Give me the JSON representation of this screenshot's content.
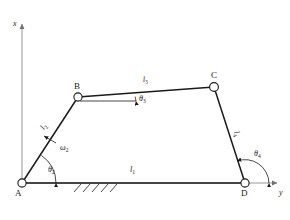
{
  "figure": {
    "type": "four-bar-linkage-kinematic-diagram",
    "background_color": "#ffffff",
    "line_color": "#1a1a1a",
    "axis_color": "#8a8a8a"
  },
  "axes": {
    "vertical": {
      "label": "x",
      "direction": "up"
    },
    "horizontal": {
      "label": "y",
      "direction": "right"
    },
    "origin_vertex": "A"
  },
  "vertices": [
    {
      "id": "A",
      "label": "A",
      "x": 22,
      "y": 183,
      "label_dx": -7,
      "label_dy": 13
    },
    {
      "id": "B",
      "label": "B",
      "x": 78,
      "y": 97,
      "label_dx": -4,
      "label_dy": -8
    },
    {
      "id": "C",
      "label": "C",
      "x": 214,
      "y": 87,
      "label_dx": -2,
      "label_dy": -9
    },
    {
      "id": "D",
      "label": "D",
      "x": 245,
      "y": 183,
      "label_dx": -3,
      "label_dy": 13
    }
  ],
  "links": [
    {
      "id": "l1",
      "label": "l",
      "subscript": "1",
      "from": "A",
      "to": "D",
      "label_x": 130,
      "label_y": 172,
      "description": "ground link"
    },
    {
      "id": "l2",
      "label": "l",
      "subscript": "2",
      "from": "A",
      "to": "B",
      "label_x": 44,
      "label_y": 130,
      "rotation": -57,
      "description": "crank"
    },
    {
      "id": "l3",
      "label": "l",
      "subscript": "3",
      "from": "B",
      "to": "C",
      "label_x": 143,
      "label_y": 82,
      "rotation": -4,
      "description": "coupler"
    },
    {
      "id": "l4",
      "label": "l",
      "subscript": "4",
      "from": "C",
      "to": "D",
      "label_x": 234,
      "label_y": 132,
      "rotation": 72,
      "description": "rocker"
    }
  ],
  "angles": [
    {
      "id": "theta2",
      "label": "θ",
      "subscript": "2",
      "at_vertex": "A",
      "label_x": 48,
      "label_y": 172
    },
    {
      "id": "theta3",
      "label": "θ",
      "subscript": "3",
      "at_vertex": "B",
      "label_x": 139,
      "label_y": 101
    },
    {
      "id": "theta4",
      "label": "θ",
      "subscript": "4",
      "at_vertex": "D",
      "label_x": 254,
      "label_y": 156
    }
  ],
  "annotations": [
    {
      "id": "omega2",
      "label": "ω",
      "subscript": "2",
      "description": "angular velocity of link 2",
      "label_x": 60,
      "label_y": 148
    }
  ],
  "ground": {
    "hatching": {
      "start_x": 72,
      "end_x": 112,
      "y": 184,
      "mark_count": 5,
      "description": "fixed frame hatching"
    }
  }
}
